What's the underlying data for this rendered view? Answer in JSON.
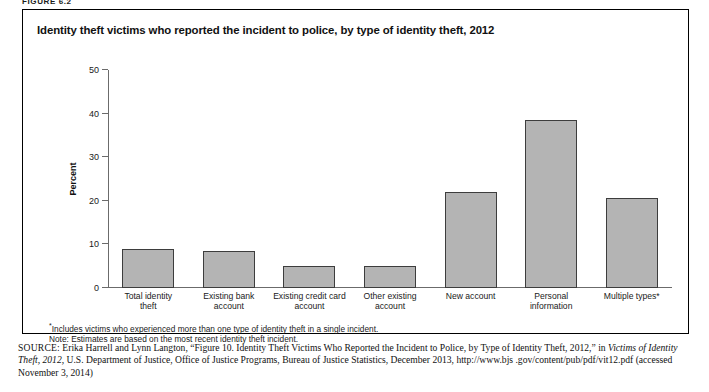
{
  "figure_label": "FIGURE 6.2",
  "panel": {
    "title": "Identity theft victims who reported the incident to police, by type of identity theft, 2012"
  },
  "notes": {
    "footnote": "Includes victims who experienced more than one type of identity theft in a single incident.",
    "note": "Note: Estimates are based on the most recent identity theft incident."
  },
  "source": {
    "label": "SOURCE:",
    "line1_a": " Erika Harrell and Lynn Langton, “Figure 10. Identity Theft Victims Who Reported the Incident to Police, by Type of Identity Theft, 2012,”",
    "line2_pre": "in ",
    "line2_italic": "Victims of Identity Theft, 2012,",
    "line2_post": " U.S. Department of Justice, Office of Justice Programs, Bureau of Justice Statistics, December 2013, http://www.bjs",
    "line3": ".gov/content/pub/pdf/vit12.pdf (accessed November 3, 2014)"
  },
  "chart_data": {
    "type": "bar",
    "title": "Identity theft victims who reported the incident to police, by type of identity theft, 2012",
    "xlabel": "",
    "ylabel": "Percent",
    "ylim": [
      0,
      50
    ],
    "yticks": [
      0,
      10,
      20,
      30,
      40,
      50
    ],
    "grid": false,
    "legend": "none",
    "bar_color": "#b4b4b4",
    "bar_edge_color": "#3d3d3d",
    "categories": [
      "Total identity\ntheft",
      "Existing bank\naccount",
      "Existing credit card\naccount",
      "Other existing\naccount",
      "New account",
      "Personal\ninformation",
      "Multiple types*"
    ],
    "values": [
      9.0,
      8.5,
      5.0,
      5.0,
      22.0,
      38.5,
      20.7
    ]
  }
}
